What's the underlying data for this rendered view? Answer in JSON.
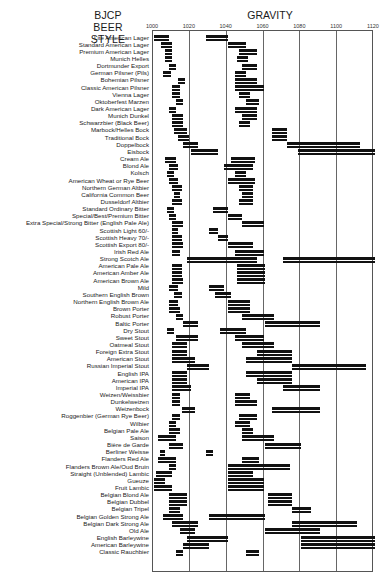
{
  "header": {
    "style_title_line1": "BJCP BEER",
    "style_title_line2": "STYLE",
    "gravity_title": "GRAVITY"
  },
  "chart_data": {
    "type": "bar",
    "subtype": "floating-range (FG and OG ranges per style)",
    "xlabel": "GRAVITY",
    "ylabel": "BJCP BEER STYLE",
    "x_ticks": [
      "1000",
      "1020",
      "1040",
      "1060",
      "1080",
      "1100",
      "1120"
    ],
    "xlim": [
      1000,
      1120
    ],
    "grid": true,
    "legend": "none",
    "series": [
      {
        "name": "Final Gravity range"
      },
      {
        "name": "Original Gravity range"
      }
    ],
    "categories": [
      {
        "style": "Lite American Lager",
        "fg": [
          1000,
          1008
        ],
        "og": [
          1028,
          1040
        ]
      },
      {
        "style": "Standard American Lager",
        "fg": [
          1004,
          1010
        ],
        "og": [
          1040,
          1050
        ]
      },
      {
        "style": "Premium American Lager",
        "fg": [
          1006,
          1010
        ],
        "og": [
          1046,
          1056
        ]
      },
      {
        "style": "Munich Helles",
        "fg": [
          1006,
          1010
        ],
        "og": [
          1045,
          1051
        ]
      },
      {
        "style": "Dortmunder Export",
        "fg": [
          1008,
          1012
        ],
        "og": [
          1048,
          1056
        ]
      },
      {
        "style": "German Pilsner (Pils)",
        "fg": [
          1005,
          1009
        ],
        "og": [
          1044,
          1050
        ]
      },
      {
        "style": "Bohemian Pilsner",
        "fg": [
          1013,
          1017
        ],
        "og": [
          1044,
          1056
        ]
      },
      {
        "style": "Classic American Pilsner",
        "fg": [
          1010,
          1014
        ],
        "og": [
          1044,
          1060
        ]
      },
      {
        "style": "Vienna Lager",
        "fg": [
          1010,
          1014
        ],
        "og": [
          1046,
          1052
        ]
      },
      {
        "style": "Oktoberfest Marzen",
        "fg": [
          1012,
          1016
        ],
        "og": [
          1050,
          1057
        ]
      },
      {
        "style": "Dark American Lager",
        "fg": [
          1008,
          1012
        ],
        "og": [
          1044,
          1056
        ]
      },
      {
        "style": "Munich Dunkel",
        "fg": [
          1010,
          1016
        ],
        "og": [
          1048,
          1056
        ]
      },
      {
        "style": "Schwarzbier (Black Beer)",
        "fg": [
          1010,
          1016
        ],
        "og": [
          1046,
          1052
        ]
      },
      {
        "style": "Marbock/Helles Bock",
        "fg": [
          1011,
          1018
        ],
        "og": [
          1064,
          1072
        ]
      },
      {
        "style": "Traditional Bock",
        "fg": [
          1013,
          1019
        ],
        "og": [
          1064,
          1072
        ]
      },
      {
        "style": "Doppelbock",
        "fg": [
          1016,
          1024
        ],
        "og": [
          1072,
          1112
        ]
      },
      {
        "style": "Eisbock",
        "fg": [
          1020,
          1035
        ],
        "og": [
          1078,
          1120
        ]
      },
      {
        "style": "Cream Ale",
        "fg": [
          1006,
          1012
        ],
        "og": [
          1042,
          1055
        ]
      },
      {
        "style": "Blond Ale",
        "fg": [
          1008,
          1013
        ],
        "og": [
          1038,
          1054
        ]
      },
      {
        "style": "Kolsch",
        "fg": [
          1007,
          1011
        ],
        "og": [
          1044,
          1050
        ]
      },
      {
        "style": "American Wheat or Rye Beer",
        "fg": [
          1008,
          1013
        ],
        "og": [
          1040,
          1055
        ]
      },
      {
        "style": "Northern German Altbier",
        "fg": [
          1010,
          1015
        ],
        "og": [
          1046,
          1054
        ]
      },
      {
        "style": "California Common Beer",
        "fg": [
          1011,
          1014
        ],
        "og": [
          1048,
          1054
        ]
      },
      {
        "style": "Dusseldorf Altbier",
        "fg": [
          1010,
          1015
        ],
        "og": [
          1046,
          1054
        ]
      },
      {
        "style": "Standard Ordinary Bitter",
        "fg": [
          1007,
          1011
        ],
        "og": [
          1032,
          1040
        ]
      },
      {
        "style": "Special/Best/Premium Bitter",
        "fg": [
          1008,
          1012
        ],
        "og": [
          1040,
          1048
        ]
      },
      {
        "style": "Extra Special/Strong Bitter (English Pale Ale)",
        "fg": [
          1010,
          1016
        ],
        "og": [
          1048,
          1060
        ]
      },
      {
        "style": "Scottish Light 60/-",
        "fg": [
          1010,
          1013
        ],
        "og": [
          1030,
          1035
        ]
      },
      {
        "style": "Scottish Heavy 70/-",
        "fg": [
          1010,
          1015
        ],
        "og": [
          1035,
          1040
        ]
      },
      {
        "style": "Scottish Export 80/-",
        "fg": [
          1010,
          1016
        ],
        "og": [
          1040,
          1054
        ]
      },
      {
        "style": "Irish Red Ale",
        "fg": [
          1010,
          1014
        ],
        "og": [
          1044,
          1060
        ]
      },
      {
        "style": "Strong Scotch Ale",
        "fg": [
          1018,
          1056
        ],
        "og": [
          1070,
          1120
        ]
      },
      {
        "style": "American Pale Ale",
        "fg": [
          1010,
          1015
        ],
        "og": [
          1045,
          1060
        ]
      },
      {
        "style": "American Amber Ale",
        "fg": [
          1010,
          1015
        ],
        "og": [
          1045,
          1060
        ]
      },
      {
        "style": "American Brown Ale",
        "fg": [
          1010,
          1016
        ],
        "og": [
          1045,
          1060
        ]
      },
      {
        "style": "Mild",
        "fg": [
          1008,
          1013
        ],
        "og": [
          1030,
          1038
        ]
      },
      {
        "style": "Southern English Brown",
        "fg": [
          1011,
          1015
        ],
        "og": [
          1033,
          1042
        ]
      },
      {
        "style": "Northern English Brown Ale",
        "fg": [
          1008,
          1013
        ],
        "og": [
          1040,
          1052
        ]
      },
      {
        "style": "Brown Porter",
        "fg": [
          1008,
          1014
        ],
        "og": [
          1040,
          1052
        ]
      },
      {
        "style": "Robust Porter",
        "fg": [
          1012,
          1016
        ],
        "og": [
          1048,
          1065
        ]
      },
      {
        "style": "Baltic Porter",
        "fg": [
          1016,
          1024
        ],
        "og": [
          1060,
          1090
        ]
      },
      {
        "style": "Dry Stout",
        "fg": [
          1007,
          1011
        ],
        "og": [
          1036,
          1050
        ]
      },
      {
        "style": "Sweet Stout",
        "fg": [
          1012,
          1024
        ],
        "og": [
          1044,
          1060
        ]
      },
      {
        "style": "Oatmeal Stout",
        "fg": [
          1010,
          1018
        ],
        "og": [
          1048,
          1065
        ]
      },
      {
        "style": "Foreign Extra Stout",
        "fg": [
          1010,
          1018
        ],
        "og": [
          1056,
          1075
        ]
      },
      {
        "style": "American Stout",
        "fg": [
          1010,
          1022
        ],
        "og": [
          1050,
          1075
        ]
      },
      {
        "style": "Russian Imperial Stout",
        "fg": [
          1018,
          1030
        ],
        "og": [
          1075,
          1115
        ]
      },
      {
        "style": "English IPA",
        "fg": [
          1010,
          1018
        ],
        "og": [
          1050,
          1075
        ]
      },
      {
        "style": "American IPA",
        "fg": [
          1010,
          1018
        ],
        "og": [
          1056,
          1075
        ]
      },
      {
        "style": "Imperial IPA",
        "fg": [
          1010,
          1020
        ],
        "og": [
          1070,
          1090
        ]
      },
      {
        "style": "Weizen/Weissbier",
        "fg": [
          1010,
          1014
        ],
        "og": [
          1044,
          1052
        ]
      },
      {
        "style": "Dunkelweizen",
        "fg": [
          1010,
          1014
        ],
        "og": [
          1044,
          1056
        ]
      },
      {
        "style": "Weizenbock",
        "fg": [
          1015,
          1022
        ],
        "og": [
          1064,
          1090
        ]
      },
      {
        "style": "Roggenbier (German Rye Beer)",
        "fg": [
          1010,
          1014
        ],
        "og": [
          1046,
          1056
        ]
      },
      {
        "style": "Wilbier",
        "fg": [
          1008,
          1012
        ],
        "og": [
          1044,
          1052
        ]
      },
      {
        "style": "Belgian Pale Ale",
        "fg": [
          1008,
          1014
        ],
        "og": [
          1048,
          1054
        ]
      },
      {
        "style": "Saison",
        "fg": [
          1002,
          1012
        ],
        "og": [
          1048,
          1065
        ]
      },
      {
        "style": "Bière de Garde",
        "fg": [
          1008,
          1016
        ],
        "og": [
          1060,
          1080
        ]
      },
      {
        "style": "Berliner Weisse",
        "fg": [
          1003,
          1006
        ],
        "og": [
          1028,
          1032
        ]
      },
      {
        "style": "Flanders Red Ale",
        "fg": [
          1002,
          1012
        ],
        "og": [
          1048,
          1057
        ]
      },
      {
        "style": "Flanders Brown Ale/Oud Bruin",
        "fg": [
          1008,
          1012
        ],
        "og": [
          1040,
          1074
        ]
      },
      {
        "style": "Straight (Unblended) Lambic",
        "fg": [
          1001,
          1010
        ],
        "og": [
          1040,
          1054
        ]
      },
      {
        "style": "Gueuze",
        "fg": [
          1000,
          1006
        ],
        "og": [
          1040,
          1060
        ]
      },
      {
        "style": "Fruit Lambic",
        "fg": [
          1000,
          1010
        ],
        "og": [
          1040,
          1060
        ]
      },
      {
        "style": "Belgian Blond Ale",
        "fg": [
          1008,
          1018
        ],
        "og": [
          1062,
          1075
        ]
      },
      {
        "style": "Belgian Dubbel",
        "fg": [
          1008,
          1018
        ],
        "og": [
          1062,
          1075
        ]
      },
      {
        "style": "Belgian Tripel",
        "fg": [
          1008,
          1014
        ],
        "og": [
          1075,
          1085
        ]
      },
      {
        "style": "Belgian Golden Strong Ale",
        "fg": [
          1005,
          1016
        ],
        "og": [
          1030,
          1060
        ]
      },
      {
        "style": "Belgian Dark Strong Ale",
        "fg": [
          1010,
          1024
        ],
        "og": [
          1075,
          1110
        ]
      },
      {
        "style": "Old Ale",
        "fg": [
          1014,
          1022
        ],
        "og": [
          1060,
          1090
        ]
      },
      {
        "style": "English Barleywine",
        "fg": [
          1018,
          1040
        ],
        "og": [
          1080,
          1120
        ]
      },
      {
        "style": "American Barleywine",
        "fg": [
          1016,
          1030
        ],
        "og": [
          1080,
          1120
        ]
      },
      {
        "style": "Classic Rauchbier",
        "fg": [
          1012,
          1016
        ],
        "og": [
          1050,
          1057
        ]
      }
    ]
  }
}
